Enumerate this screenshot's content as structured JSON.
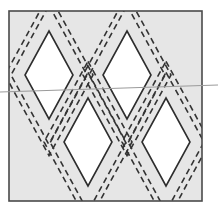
{
  "diagram": {
    "type": "quilt-pattern-diamonds",
    "colors": {
      "background": "#ffffff",
      "panel_fill": "#e6e6e6",
      "border": "#4a4a4a",
      "diamond_fill": "#ffffff",
      "diamond_stroke": "#2e2e2e",
      "dashed_stroke": "#333333",
      "scan_line": "#9a9a9a"
    },
    "panel": {
      "x": 9,
      "y": 11,
      "width": 193,
      "height": 190
    },
    "diamonds": [
      {
        "id": "top-left",
        "cx": 49,
        "cy": 75,
        "rx": 24,
        "ry": 44
      },
      {
        "id": "top-right",
        "cx": 127,
        "cy": 75,
        "rx": 24,
        "ry": 44
      },
      {
        "id": "bottom-left",
        "cx": 88,
        "cy": 142,
        "rx": 24,
        "ry": 44
      },
      {
        "id": "bottom-right",
        "cx": 166,
        "cy": 142,
        "rx": 24,
        "ry": 44
      }
    ],
    "seam_offset": 14,
    "outer_offset": 20,
    "scan_line": {
      "x1": 0,
      "y1": 92,
      "x2": 218,
      "y2": 85
    }
  }
}
